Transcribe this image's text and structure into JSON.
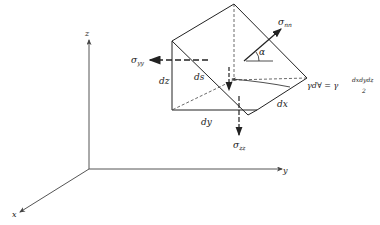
{
  "diagram": {
    "type": "free-body wedge element with normal stresses",
    "axes": {
      "x": "x",
      "y": "y",
      "z": "z"
    },
    "stresses": {
      "normal": {
        "symbol": "σ",
        "subscript": "nn"
      },
      "yy": {
        "symbol": "σ",
        "subscript": "yy"
      },
      "zz": {
        "symbol": "σ",
        "subscript": "zz"
      }
    },
    "dimensions": {
      "dx": "dx",
      "dy": "dy",
      "dz": "dz",
      "ds": "ds"
    },
    "angle": "α",
    "weight_label": {
      "left": "γd∀ = γ",
      "numerator": "dxdydz",
      "denominator": "2"
    }
  }
}
